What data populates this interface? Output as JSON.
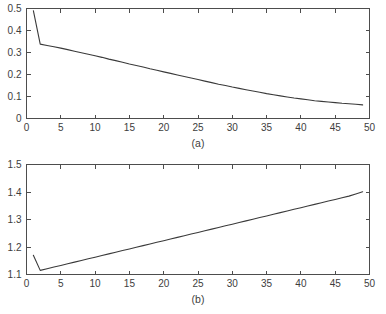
{
  "chart_data": [
    {
      "type": "line",
      "title": "",
      "subtitle": "",
      "annotation": "(a)",
      "xlabel": "",
      "ylabel": "",
      "xlim": [
        0,
        50
      ],
      "ylim": [
        0,
        0.5
      ],
      "xticks": [
        0,
        5,
        10,
        15,
        20,
        25,
        30,
        35,
        40,
        45,
        50
      ],
      "xticklabels": [
        "0",
        "5",
        "10",
        "15",
        "20",
        "25",
        "30",
        "35",
        "40",
        "45",
        "50"
      ],
      "yticks": [
        0,
        0.1,
        0.2,
        0.3,
        0.4,
        0.5
      ],
      "yticklabels": [
        "0",
        "0.1",
        "0.2",
        "0.3",
        "0.4",
        "0.5"
      ],
      "grid": false,
      "legend": null,
      "line_color": "#3a3a3a",
      "series": [
        {
          "name": "series-a",
          "x": [
            1,
            2,
            3,
            4,
            5,
            6,
            7,
            8,
            9,
            10,
            11,
            12,
            13,
            14,
            15,
            16,
            17,
            18,
            19,
            20,
            21,
            22,
            23,
            24,
            25,
            26,
            27,
            28,
            29,
            30,
            31,
            32,
            33,
            34,
            35,
            36,
            37,
            38,
            39,
            40,
            41,
            42,
            43,
            44,
            45,
            46,
            47,
            48,
            49
          ],
          "values": [
            0.49,
            0.338,
            0.332,
            0.326,
            0.32,
            0.313,
            0.306,
            0.299,
            0.292,
            0.285,
            0.278,
            0.27,
            0.263,
            0.256,
            0.248,
            0.241,
            0.234,
            0.226,
            0.219,
            0.212,
            0.205,
            0.198,
            0.191,
            0.184,
            0.177,
            0.17,
            0.163,
            0.156,
            0.15,
            0.143,
            0.137,
            0.131,
            0.125,
            0.119,
            0.113,
            0.108,
            0.103,
            0.098,
            0.093,
            0.089,
            0.085,
            0.081,
            0.078,
            0.075,
            0.072,
            0.069,
            0.067,
            0.065,
            0.062
          ]
        }
      ]
    },
    {
      "type": "line",
      "title": "",
      "subtitle": "",
      "annotation": "(b)",
      "xlabel": "",
      "ylabel": "",
      "xlim": [
        0,
        50
      ],
      "ylim": [
        1.1,
        1.5
      ],
      "xticks": [
        0,
        5,
        10,
        15,
        20,
        25,
        30,
        35,
        40,
        45,
        50
      ],
      "xticklabels": [
        "0",
        "5",
        "10",
        "15",
        "20",
        "25",
        "30",
        "35",
        "40",
        "45",
        "50"
      ],
      "yticks": [
        1.1,
        1.2,
        1.3,
        1.4,
        1.5
      ],
      "yticklabels": [
        "1.1",
        "1.2",
        "1.3",
        "1.4",
        "1.5"
      ],
      "grid": false,
      "legend": null,
      "line_color": "#3a3a3a",
      "series": [
        {
          "name": "series-b",
          "x": [
            1,
            2,
            3,
            4,
            5,
            6,
            7,
            8,
            9,
            10,
            11,
            12,
            13,
            14,
            15,
            16,
            17,
            18,
            19,
            20,
            21,
            22,
            23,
            24,
            25,
            26,
            27,
            28,
            29,
            30,
            31,
            32,
            33,
            34,
            35,
            36,
            37,
            38,
            39,
            40,
            41,
            42,
            43,
            44,
            45,
            46,
            47,
            48,
            49
          ],
          "values": [
            1.17,
            1.115,
            1.121,
            1.127,
            1.133,
            1.139,
            1.145,
            1.151,
            1.157,
            1.163,
            1.169,
            1.175,
            1.181,
            1.187,
            1.193,
            1.199,
            1.205,
            1.211,
            1.217,
            1.223,
            1.229,
            1.235,
            1.241,
            1.247,
            1.253,
            1.259,
            1.265,
            1.271,
            1.277,
            1.283,
            1.289,
            1.295,
            1.301,
            1.307,
            1.313,
            1.319,
            1.325,
            1.331,
            1.337,
            1.343,
            1.349,
            1.355,
            1.361,
            1.367,
            1.373,
            1.379,
            1.385,
            1.393,
            1.401
          ]
        }
      ]
    }
  ]
}
